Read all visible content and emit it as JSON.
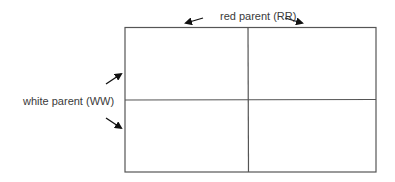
{
  "diagram": {
    "type": "punnett-square",
    "rows": 2,
    "columns": 2,
    "top_label": "red parent (RR)",
    "left_label": "white parent (WW)",
    "cells": [
      [
        "",
        ""
      ],
      [
        "",
        ""
      ]
    ],
    "colors": {
      "line": "#555555",
      "text": "#3a3a3a",
      "arrow": "#111111"
    }
  }
}
